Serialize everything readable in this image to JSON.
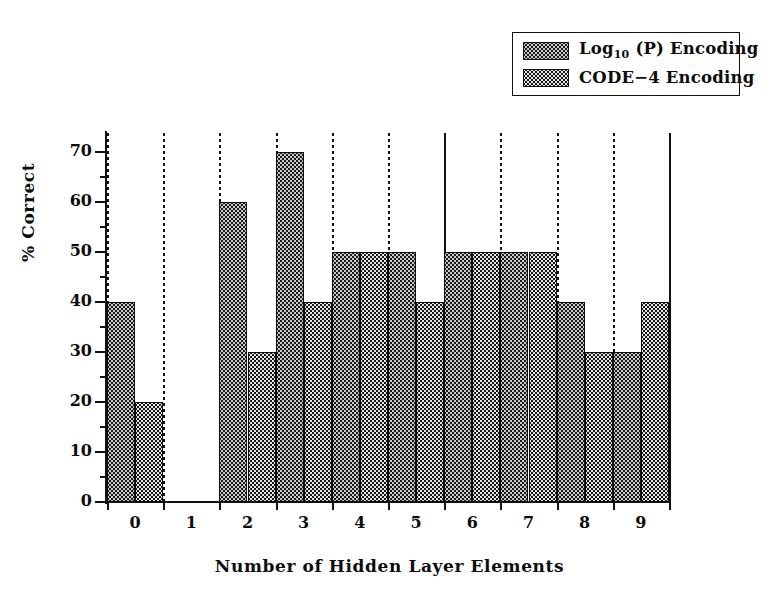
{
  "chart_data": {
    "type": "bar",
    "title": "",
    "subtitle": "",
    "xlabel": "Number of Hidden Layer Elements",
    "ylabel": "% Correct",
    "categories": [
      "0",
      "1",
      "2",
      "3",
      "4",
      "5",
      "6",
      "7",
      "8",
      "9"
    ],
    "series": [
      {
        "name": "Log10 (P) Encoding",
        "name_html": "Log<sub>10</sub> (P) Encoding",
        "color": "#c9c9c9",
        "pattern": "light-dotted",
        "values": [
          40,
          null,
          60,
          70,
          50,
          50,
          50,
          50,
          40,
          30
        ]
      },
      {
        "name": "CODE-4 Encoding",
        "name_html": "CODE−4 Encoding",
        "color": "#161616",
        "pattern": "dark-dotted",
        "values": [
          20,
          null,
          30,
          40,
          50,
          40,
          50,
          50,
          30,
          40
        ]
      }
    ],
    "ylim": [
      0,
      74
    ],
    "yticks": [
      0,
      10,
      20,
      30,
      40,
      50,
      60,
      70
    ],
    "ytick_labels": [
      "0",
      "10",
      "20",
      "30",
      "40",
      "50",
      "60",
      "70"
    ],
    "yminor_ticks": [
      5,
      15,
      25,
      35,
      45,
      55,
      65
    ],
    "grid": "vertical-dotted-category-boundaries",
    "legend_position": "top-right"
  },
  "legend": {
    "entries": [
      {
        "label_html": "Log<sub>10</sub> (P) Encoding",
        "swatch": "light-dotted-swatch"
      },
      {
        "label_html": "CODE−4 Encoding",
        "swatch": "dark-dotted-swatch"
      }
    ]
  },
  "axes": {
    "x_title": "Number of Hidden Layer Elements",
    "y_title": "% Correct"
  }
}
